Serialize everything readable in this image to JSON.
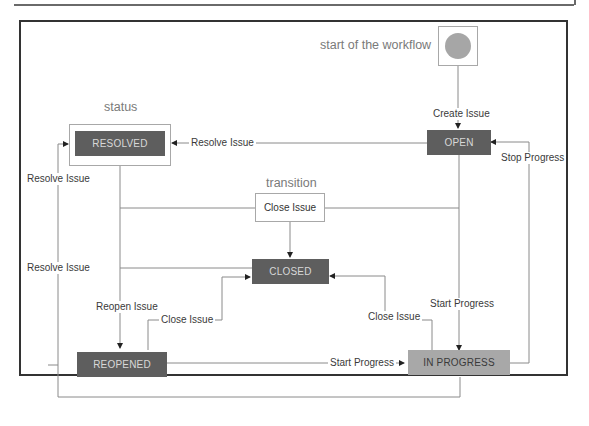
{
  "captions": {
    "start": "start of the workflow",
    "status": "status",
    "transition": "transition"
  },
  "statuses": {
    "open": "OPEN",
    "resolved": "RESOLVED",
    "closed": "CLOSED",
    "reopened": "REOPENED",
    "in_progress": "IN PROGRESS"
  },
  "transitions": {
    "create_issue": "Create Issue",
    "resolve_issue_top": "Resolve Issue",
    "resolve_issue_left_1": "Resolve Issue",
    "resolve_issue_left_2": "Resolve Issue",
    "close_issue_center": "Close Issue",
    "close_issue_reopened": "Close Issue",
    "close_issue_inprogress": "Close Issue",
    "reopen_issue": "Reopen Issue",
    "start_progress_open": "Start Progress",
    "start_progress_reopened": "Start Progress",
    "stop_progress": "Stop Progress"
  },
  "colors": {
    "status_dark": "#5e5e5e",
    "status_light": "#a8a8a8",
    "start_node": "#a6a6a6",
    "wire": "#8a8a8a",
    "frame": "#333333"
  }
}
